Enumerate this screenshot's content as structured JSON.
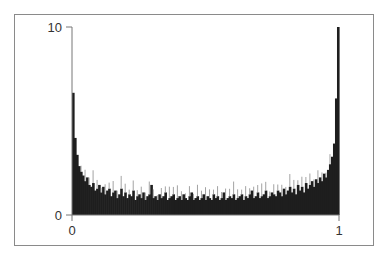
{
  "chart_data": {
    "type": "bar",
    "title": "",
    "xlabel": "",
    "ylabel": "",
    "xlim": [
      0,
      1
    ],
    "ylim": [
      0,
      10
    ],
    "grid": false,
    "legend": null,
    "x_ticks": [
      "0",
      "1"
    ],
    "y_ticks": [
      "0",
      "10"
    ],
    "bins": 133,
    "bin_heights": [
      6.5,
      4.1,
      3.2,
      2.6,
      2.3,
      2.1,
      1.8,
      2.0,
      1.6,
      1.5,
      1.7,
      1.3,
      1.4,
      1.6,
      1.2,
      1.5,
      1.1,
      1.3,
      1.4,
      1.0,
      1.2,
      1.3,
      0.9,
      1.1,
      1.4,
      1.0,
      1.2,
      0.9,
      1.1,
      1.0,
      1.3,
      0.8,
      1.0,
      1.1,
      0.9,
      1.2,
      0.8,
      1.0,
      1.1,
      1.6,
      0.9,
      1.0,
      0.8,
      1.1,
      0.9,
      1.0,
      1.2,
      0.8,
      0.9,
      1.0,
      1.1,
      0.8,
      0.9,
      1.0,
      0.8,
      1.1,
      0.9,
      0.8,
      1.0,
      1.2,
      0.8,
      0.9,
      1.0,
      0.8,
      0.9,
      1.1,
      0.8,
      1.0,
      0.9,
      0.8,
      1.1,
      0.9,
      1.0,
      0.8,
      0.9,
      1.2,
      0.8,
      0.9,
      1.0,
      0.9,
      1.1,
      0.8,
      0.9,
      1.0,
      1.1,
      0.8,
      1.0,
      0.9,
      1.1,
      1.3,
      0.9,
      1.0,
      1.2,
      0.9,
      1.0,
      1.1,
      1.3,
      0.9,
      1.0,
      1.2,
      1.1,
      1.0,
      1.3,
      1.2,
      1.0,
      1.4,
      1.1,
      1.3,
      1.5,
      1.2,
      1.4,
      1.1,
      1.6,
      1.3,
      1.5,
      1.2,
      1.7,
      1.4,
      1.6,
      1.8,
      1.5,
      1.9,
      1.7,
      2.0,
      1.8,
      2.2,
      2.0,
      2.4,
      2.7,
      3.1,
      3.8,
      6.2,
      10.0
    ]
  },
  "axes": {
    "y_top_label": "10",
    "y_bottom_label": "0",
    "x_left_label": "0",
    "x_right_label": "1"
  },
  "colors": {
    "bars": "#1e1e1e",
    "bar_highlights": "#8c8c8c",
    "axis": "#555555",
    "frame": "#8a8a8a"
  }
}
